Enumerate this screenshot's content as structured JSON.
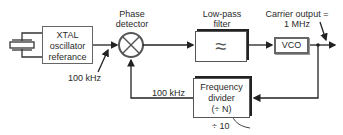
{
  "diagram": {
    "type": "PLL block diagram",
    "blocks": {
      "xtal": {
        "lines": [
          "XTAL",
          "oscillator",
          "referance"
        ]
      },
      "phase_detector": {
        "label_lines": [
          "Phase",
          "detector"
        ]
      },
      "low_pass_filter": {
        "label_lines": [
          "Low-pass",
          "filter"
        ],
        "symbol": "≈"
      },
      "vco": {
        "label": "VCO"
      },
      "frequency_divider": {
        "lines": [
          "Frequency",
          "divider",
          "(÷ N)"
        ],
        "note": "÷ 10"
      }
    },
    "annotations": {
      "ref_freq": "100 kHz",
      "feedback_freq": "100 kHz",
      "carrier_output_lines": [
        "Carrier output =",
        "1 MHz"
      ]
    },
    "colors": {
      "line": "#222222",
      "box_border": "#555555",
      "shadow": "#222222"
    }
  }
}
